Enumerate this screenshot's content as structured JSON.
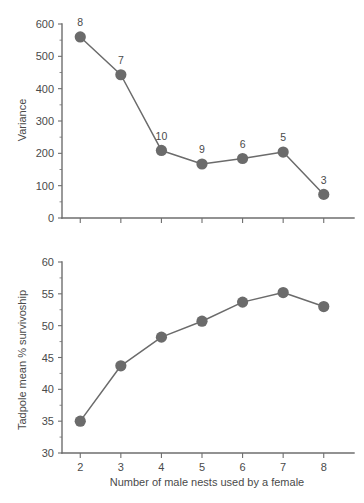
{
  "figure": {
    "background_color": "#ffffff",
    "marker_color": "#6b6b6b",
    "line_color": "#6b6b6b",
    "axis_color": "#6e6e6e",
    "text_color": "#4a4a4a"
  },
  "panels": {
    "top": {
      "ylabel": "Variance",
      "y_ticks": [
        "0",
        "100",
        "200",
        "300",
        "400",
        "500",
        "600"
      ],
      "x_tick_labels": [
        "",
        "",
        "",
        "",
        "",
        "",
        ""
      ]
    },
    "bottom": {
      "ylabel": "Tadpole mean % survivoship",
      "xlabel": "Number of male nests used by a female",
      "y_ticks": [
        "30",
        "35",
        "40",
        "45",
        "50",
        "55",
        "60"
      ],
      "x_ticks": [
        "2",
        "3",
        "4",
        "5",
        "6",
        "7",
        "8"
      ]
    }
  },
  "chart_data": [
    {
      "type": "line",
      "title": "",
      "xlabel": "",
      "ylabel": "Variance",
      "x": [
        2,
        3,
        4,
        5,
        6,
        7,
        8
      ],
      "values": [
        560,
        443,
        209,
        167,
        184,
        204,
        73
      ],
      "point_labels": [
        "8",
        "7",
        "10",
        "9",
        "6",
        "5",
        "3"
      ],
      "point_label_meaning": "sample size",
      "xlim": [
        1.55,
        8.45
      ],
      "ylim": [
        0,
        600
      ],
      "yticks": [
        0,
        100,
        200,
        300,
        400,
        500,
        600
      ],
      "y_minor_ticks": [
        50,
        150,
        250,
        350,
        450,
        550
      ],
      "xticks": [
        2,
        3,
        4,
        5,
        6,
        7,
        8
      ],
      "xticklabels": [
        "",
        "",
        "",
        "",
        "",
        "",
        ""
      ],
      "grid": false,
      "legend": false,
      "marker": "circle",
      "marker_color": "#6b6b6b",
      "line_color": "#6b6b6b"
    },
    {
      "type": "line",
      "title": "",
      "xlabel": "Number of male nests used by a female",
      "ylabel": "Tadpole mean % survivoship",
      "x": [
        2,
        3,
        4,
        5,
        6,
        7,
        8
      ],
      "values": [
        35.0,
        43.7,
        48.2,
        50.7,
        53.7,
        55.2,
        53.0
      ],
      "xlim": [
        1.55,
        8.45
      ],
      "ylim": [
        30,
        60
      ],
      "yticks": [
        30,
        35,
        40,
        45,
        50,
        55,
        60
      ],
      "y_minor_ticks": [
        32.5,
        37.5,
        42.5,
        47.5,
        52.5,
        57.5
      ],
      "xticks": [
        2,
        3,
        4,
        5,
        6,
        7,
        8
      ],
      "xticklabels": [
        "2",
        "3",
        "4",
        "5",
        "6",
        "7",
        "8"
      ],
      "grid": false,
      "legend": false,
      "marker": "circle",
      "marker_color": "#6b6b6b",
      "line_color": "#6b6b6b"
    }
  ]
}
